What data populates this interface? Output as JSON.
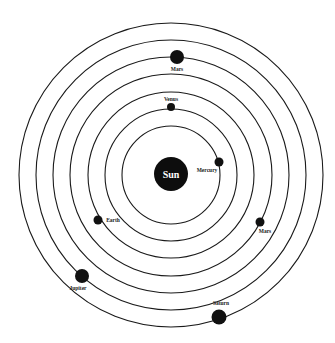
{
  "diagram": {
    "type": "solar-system-orbits",
    "center": {
      "x": 171,
      "y": 175
    },
    "orbit_radii": [
      49,
      66,
      83,
      101,
      118,
      135,
      152
    ],
    "colors": {
      "background": "#ffffff",
      "ink": "#111111",
      "sun_text": "#ffffff"
    },
    "sun": {
      "label": "Sun",
      "cx": 171,
      "cy": 174,
      "r": 17
    },
    "planets": [
      {
        "label": "Mars",
        "cx": 177,
        "cy": 57,
        "r": 7,
        "label_x": 177,
        "label_y": 71
      },
      {
        "label": "Venus",
        "cx": 171,
        "cy": 107,
        "r": 4,
        "label_x": 171,
        "label_y": 101
      },
      {
        "label": "Mercury",
        "cx": 219,
        "cy": 162,
        "r": 4.5,
        "label_x": 207,
        "label_y": 172
      },
      {
        "label": "Earth",
        "cx": 98,
        "cy": 220,
        "r": 4.5,
        "label_x": 113,
        "label_y": 222
      },
      {
        "label": "Mars",
        "cx": 260,
        "cy": 222,
        "r": 4.5,
        "label_x": 265,
        "label_y": 233
      },
      {
        "label": "Jupiter",
        "cx": 82,
        "cy": 276,
        "r": 7,
        "label_x": 78,
        "label_y": 290
      },
      {
        "label": "Saturn",
        "cx": 219,
        "cy": 317,
        "r": 7.5,
        "label_x": 221,
        "label_y": 305
      }
    ]
  }
}
